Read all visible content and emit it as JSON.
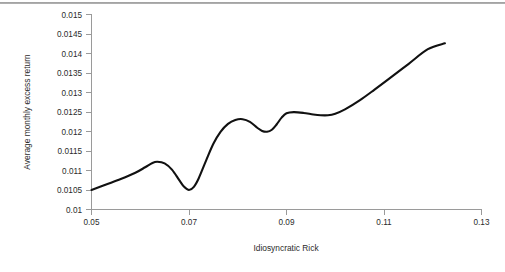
{
  "chart_data": {
    "type": "line",
    "title": "",
    "xlabel": "Idiosyncratic Rick",
    "ylabel": "Average monthly excess return",
    "xlim": [
      0.05,
      0.13
    ],
    "ylim": [
      0.01,
      0.015
    ],
    "grid": false,
    "legend": null,
    "line_color": "#111111",
    "axis_color": "#9a9a9a",
    "xticks": [
      "0.05",
      "0.07",
      "0.09",
      "0.11",
      "0.13"
    ],
    "xtick_values": [
      0.05,
      0.07,
      0.09,
      0.11,
      0.13
    ],
    "yticks": [
      "0.01",
      "0.0105",
      "0.011",
      "0.0115",
      "0.012",
      "0.0125",
      "0.013",
      "0.0135",
      "0.014",
      "0.0145",
      "0.015"
    ],
    "ytick_values": [
      0.01,
      0.0105,
      0.011,
      0.0115,
      0.012,
      0.0125,
      0.013,
      0.0135,
      0.014,
      0.0145,
      0.015
    ],
    "series": [
      {
        "name": "Average monthly excess return",
        "x": [
          0.05,
          0.053,
          0.056,
          0.059,
          0.061,
          0.0625,
          0.0635,
          0.065,
          0.0665,
          0.068,
          0.069,
          0.07,
          0.071,
          0.072,
          0.0735,
          0.075,
          0.0765,
          0.078,
          0.0795,
          0.081,
          0.0825,
          0.084,
          0.085,
          0.086,
          0.087,
          0.088,
          0.089,
          0.09,
          0.0915,
          0.0935,
          0.0955,
          0.097,
          0.0985,
          0.1,
          0.102,
          0.105,
          0.108,
          0.111,
          0.115,
          0.119,
          0.1225
        ],
        "y": [
          0.0105,
          0.01064,
          0.01078,
          0.01094,
          0.01108,
          0.01119,
          0.01122,
          0.01118,
          0.01102,
          0.01075,
          0.01058,
          0.0105,
          0.01058,
          0.0108,
          0.01125,
          0.01168,
          0.01199,
          0.01219,
          0.01229,
          0.01231,
          0.01224,
          0.01209,
          0.01201,
          0.01199,
          0.01204,
          0.01218,
          0.01235,
          0.01246,
          0.01249,
          0.01247,
          0.01243,
          0.01241,
          0.01241,
          0.01245,
          0.01256,
          0.01279,
          0.01306,
          0.01334,
          0.01372,
          0.0141,
          0.01425
        ]
      }
    ],
    "annotations": []
  },
  "figure": {
    "top_rule_color": "#8e8e8e",
    "background_color": "#ffffff"
  }
}
